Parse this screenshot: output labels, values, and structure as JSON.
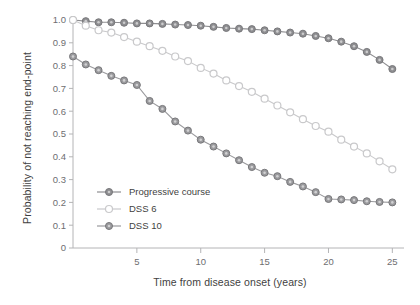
{
  "chart_data": {
    "type": "line",
    "title": "",
    "xlabel": "Time from disease onset (years)",
    "ylabel": "Probability of not reaching end-point",
    "xlim": [
      0,
      25.6
    ],
    "ylim": [
      0,
      1.0
    ],
    "grid": false,
    "legend_position": "inside-lower-left",
    "xticks": [
      5,
      10,
      15,
      20,
      25
    ],
    "xtick_labels": [
      "5",
      "10",
      "15",
      "20",
      "25"
    ],
    "yticks": [
      0,
      0.1,
      0.2,
      0.3,
      0.4,
      0.5,
      0.6,
      0.7,
      0.8,
      0.9,
      1.0
    ],
    "ytick_labels": [
      "0",
      "0.1",
      "0.2",
      "0.3",
      "0.4",
      "0.5",
      "0.6",
      "0.7",
      "0.8",
      "0.9",
      "1.0"
    ],
    "x": [
      0,
      1,
      2,
      3,
      4,
      5,
      6,
      7,
      8,
      9,
      10,
      11,
      12,
      13,
      14,
      15,
      16,
      17,
      18,
      19,
      20,
      21,
      22,
      23,
      24,
      25
    ],
    "series": [
      {
        "name": "Progressive course",
        "color": "#8e8e91",
        "marker": "filled-circle",
        "values": [
          1.0,
          0.995,
          0.99,
          0.99,
          0.988,
          0.985,
          0.985,
          0.983,
          0.98,
          0.978,
          0.975,
          0.97,
          0.965,
          0.962,
          0.96,
          0.955,
          0.95,
          0.945,
          0.94,
          0.93,
          0.92,
          0.905,
          0.885,
          0.86,
          0.825,
          0.785
        ]
      },
      {
        "name": "DSS 6",
        "color": "#c9c9cb",
        "marker": "open-circle",
        "values": [
          1.0,
          0.975,
          0.955,
          0.945,
          0.925,
          0.905,
          0.885,
          0.865,
          0.84,
          0.82,
          0.79,
          0.765,
          0.735,
          0.71,
          0.685,
          0.655,
          0.625,
          0.595,
          0.565,
          0.535,
          0.51,
          0.475,
          0.445,
          0.415,
          0.38,
          0.345
        ]
      },
      {
        "name": "DSS 10",
        "color": "#9a9a9d",
        "marker": "filled-circle",
        "values": [
          0.84,
          0.805,
          0.78,
          0.755,
          0.735,
          0.715,
          0.645,
          0.61,
          0.555,
          0.515,
          0.475,
          0.445,
          0.415,
          0.385,
          0.355,
          0.33,
          0.315,
          0.29,
          0.27,
          0.245,
          0.215,
          0.213,
          0.21,
          0.205,
          0.202,
          0.2
        ]
      }
    ]
  },
  "legend": {
    "items": [
      {
        "label": "Progressive course",
        "color": "#8e8e91",
        "marker": "filled-circle"
      },
      {
        "label": "DSS 6",
        "color": "#c9c9cb",
        "marker": "open-circle"
      },
      {
        "label": "DSS 10",
        "color": "#9a9a9d",
        "marker": "filled-circle"
      }
    ]
  }
}
